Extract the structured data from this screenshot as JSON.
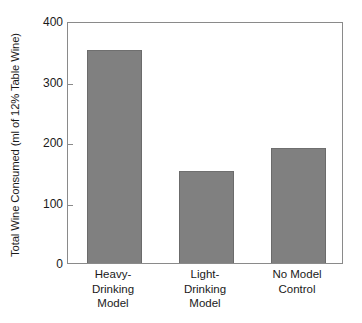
{
  "chart_data": {
    "type": "bar",
    "title": "",
    "xlabel": "",
    "ylabel": "Total Wine Consumed (ml of 12% Table Wine)",
    "categories": [
      "Heavy-Drinking Model",
      "Light-Drinking Model",
      "No Model Control"
    ],
    "category_lines": [
      [
        "Heavy-",
        "Drinking",
        "Model"
      ],
      [
        "Light-",
        "Drinking",
        "Model"
      ],
      [
        "No Model",
        "Control"
      ]
    ],
    "values": [
      352,
      152,
      190
    ],
    "ylim": [
      0,
      400
    ],
    "yticks": [
      0,
      100,
      200,
      300,
      400
    ],
    "ytick_labels": [
      "0",
      "100",
      "200",
      "300",
      "400"
    ],
    "grid": false,
    "legend": false,
    "bar_color": "#808080",
    "bar_edge_color": "#6b6b6b",
    "axis_color": "#8a8a8a",
    "background_color": "#ffffff",
    "text_color": "#1a1a1a"
  }
}
